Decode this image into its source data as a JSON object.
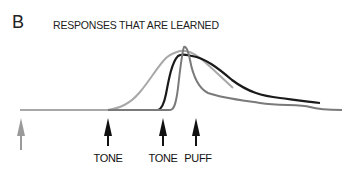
{
  "panel": {
    "letter": "B",
    "title": "RESPONSES THAT ARE LEARNED"
  },
  "markers": [
    {
      "label": "",
      "color": "#9a9a9a",
      "x": 21
    },
    {
      "label": "TONE",
      "color": "#111111",
      "x": 108
    },
    {
      "label": "TONE",
      "color": "#111111",
      "x": 163
    },
    {
      "label": "PUFF",
      "color": "#111111",
      "x": 196
    }
  ],
  "curves": [
    {
      "name": "early-learned-response",
      "color": "#a8a8a8"
    },
    {
      "name": "learned-response",
      "color": "#1a1a1a"
    },
    {
      "name": "reflex-response",
      "color": "#7a7a7a"
    }
  ]
}
